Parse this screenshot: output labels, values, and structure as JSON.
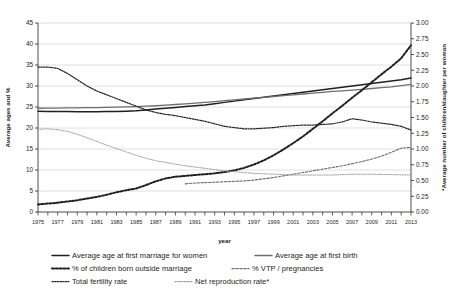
{
  "chart_data": {
    "type": "line",
    "title": "",
    "xlabel": "year",
    "ylabel": "Average ages and %",
    "y2label": "*Average number of children/daughter per woman",
    "xlim": [
      1975,
      2013
    ],
    "ylim": [
      0,
      45
    ],
    "y2lim": [
      0,
      3.0
    ],
    "grid": true,
    "legend_position": "bottom",
    "y_ticks": [
      "0",
      "5",
      "10",
      "15",
      "20",
      "25",
      "30",
      "35",
      "40",
      "45"
    ],
    "y2_ticks": [
      "0.00",
      "0.25",
      "0.50",
      "0.75",
      "1.00",
      "1.25",
      "1.50",
      "1.75",
      "2.00",
      "2.25",
      "2.50",
      "2.75",
      "3.00"
    ],
    "x_ticks": [
      "1975",
      "1977",
      "1979",
      "1981",
      "1983",
      "1985",
      "1987",
      "1989",
      "1991",
      "1993",
      "1995",
      "1997",
      "1999",
      "2001",
      "2003",
      "2005",
      "2007",
      "2009",
      "2011",
      "2013"
    ],
    "x_all_years": [
      1975,
      1976,
      1977,
      1978,
      1979,
      1980,
      1981,
      1982,
      1983,
      1984,
      1985,
      1986,
      1987,
      1988,
      1989,
      1990,
      1991,
      1992,
      1993,
      1994,
      1995,
      1996,
      1997,
      1998,
      1999,
      2000,
      2001,
      2002,
      2003,
      2004,
      2005,
      2006,
      2007,
      2008,
      2009,
      2010,
      2011,
      2012,
      2013
    ],
    "series": [
      {
        "name": "Average age at first marriage for women",
        "axis": "left",
        "style": "solid",
        "color": "#231f20",
        "width": 1.5,
        "x": [
          1975,
          1976,
          1977,
          1978,
          1979,
          1980,
          1981,
          1982,
          1983,
          1984,
          1985,
          1986,
          1987,
          1988,
          1989,
          1990,
          1991,
          1992,
          1993,
          1994,
          1995,
          1996,
          1997,
          1998,
          1999,
          2000,
          2001,
          2002,
          2003,
          2004,
          2005,
          2006,
          2007,
          2008,
          2009,
          2010,
          2011,
          2012,
          2013
        ],
        "values": [
          24.0,
          23.95,
          23.9,
          23.9,
          23.85,
          23.85,
          23.85,
          23.9,
          23.95,
          24.0,
          24.1,
          24.3,
          24.5,
          24.7,
          24.9,
          25.1,
          25.3,
          25.5,
          25.8,
          26.1,
          26.4,
          26.7,
          27.0,
          27.3,
          27.6,
          27.9,
          28.2,
          28.5,
          28.8,
          29.1,
          29.4,
          29.7,
          30.0,
          30.3,
          30.6,
          30.9,
          31.2,
          31.5,
          31.9
        ]
      },
      {
        "name": "Average age at first birth",
        "axis": "left",
        "style": "solid",
        "color": "#6d6e70",
        "width": 1.3,
        "x": [
          1975,
          1976,
          1977,
          1978,
          1979,
          1980,
          1981,
          1982,
          1983,
          1984,
          1985,
          1986,
          1987,
          1988,
          1989,
          1990,
          1991,
          1992,
          1993,
          1994,
          1995,
          1996,
          1997,
          1998,
          1999,
          2000,
          2001,
          2002,
          2003,
          2004,
          2005,
          2006,
          2007,
          2008,
          2009,
          2010,
          2011,
          2012,
          2013
        ],
        "values": [
          24.7,
          24.72,
          24.74,
          24.77,
          24.8,
          24.83,
          24.87,
          24.92,
          24.97,
          25.03,
          25.1,
          25.2,
          25.3,
          25.45,
          25.6,
          25.75,
          25.9,
          26.1,
          26.3,
          26.5,
          26.7,
          26.9,
          27.1,
          27.3,
          27.5,
          27.7,
          27.9,
          28.1,
          28.3,
          28.5,
          28.7,
          28.85,
          29.0,
          29.2,
          29.4,
          29.6,
          29.8,
          30.1,
          30.4
        ]
      },
      {
        "name": "% of children born outside marriage",
        "axis": "left",
        "style": "dotted-bold",
        "color": "#231f20",
        "width": 2.0,
        "x": [
          1975,
          1976,
          1977,
          1978,
          1979,
          1980,
          1981,
          1982,
          1983,
          1984,
          1985,
          1986,
          1987,
          1988,
          1989,
          1990,
          1991,
          1992,
          1993,
          1994,
          1995,
          1996,
          1997,
          1998,
          1999,
          2000,
          2001,
          2002,
          2003,
          2004,
          2005,
          2006,
          2007,
          2008,
          2009,
          2010,
          2011,
          2012,
          2013
        ],
        "values": [
          1.8,
          2.0,
          2.2,
          2.5,
          2.8,
          3.2,
          3.6,
          4.1,
          4.7,
          5.2,
          5.6,
          6.4,
          7.3,
          8.0,
          8.4,
          8.6,
          8.8,
          9.0,
          9.2,
          9.5,
          9.9,
          10.5,
          11.3,
          12.3,
          13.5,
          14.9,
          16.4,
          18.0,
          19.8,
          21.6,
          23.5,
          25.3,
          27.2,
          29.0,
          30.9,
          32.8,
          34.6,
          36.6,
          39.7
        ]
      },
      {
        "name": "% VTP / pregnancies",
        "axis": "left",
        "style": "dashed",
        "color": "#6d6e70",
        "width": 1.1,
        "x": [
          1990,
          1991,
          1992,
          1993,
          1994,
          1995,
          1996,
          1997,
          1998,
          1999,
          2000,
          2001,
          2002,
          2003,
          2004,
          2005,
          2006,
          2007,
          2008,
          2009,
          2010,
          2011,
          2012,
          2013
        ],
        "values": [
          6.7,
          6.9,
          7.0,
          7.1,
          7.2,
          7.3,
          7.4,
          7.6,
          7.9,
          8.2,
          8.6,
          9.0,
          9.4,
          9.8,
          10.2,
          10.6,
          11.0,
          11.5,
          12.0,
          12.6,
          13.3,
          14.2,
          15.2,
          15.4
        ]
      },
      {
        "name": "Total fertility rate",
        "axis": "right",
        "style": "dotted",
        "color": "#231f20",
        "width": 1.2,
        "x": [
          1975,
          1976,
          1977,
          1978,
          1979,
          1980,
          1981,
          1982,
          1983,
          1984,
          1985,
          1986,
          1987,
          1988,
          1989,
          1990,
          1991,
          1992,
          1993,
          1994,
          1995,
          1996,
          1997,
          1998,
          1999,
          2000,
          2001,
          2002,
          2003,
          2004,
          2005,
          2006,
          2007,
          2008,
          2009,
          2010,
          2011,
          2012,
          2013
        ],
        "values": [
          2.3,
          2.3,
          2.28,
          2.2,
          2.1,
          2.0,
          1.92,
          1.86,
          1.8,
          1.74,
          1.68,
          1.62,
          1.58,
          1.55,
          1.53,
          1.5,
          1.47,
          1.44,
          1.4,
          1.36,
          1.34,
          1.32,
          1.32,
          1.33,
          1.34,
          1.36,
          1.37,
          1.38,
          1.38,
          1.39,
          1.4,
          1.43,
          1.48,
          1.46,
          1.43,
          1.41,
          1.39,
          1.36,
          1.3
        ]
      },
      {
        "name": "Net reproduction rate*",
        "axis": "left",
        "style": "fine-dotted",
        "color": "#9a9b9e",
        "width": 1.0,
        "x": [
          1975,
          1976,
          1977,
          1978,
          1979,
          1980,
          1981,
          1982,
          1983,
          1984,
          1985,
          1986,
          1987,
          1988,
          1989,
          1990,
          1991,
          1992,
          1993,
          1994,
          1995,
          1996,
          1997,
          1998,
          1999,
          2000,
          2001,
          2002,
          2003,
          2004,
          2005,
          2006,
          2007,
          2008,
          2009,
          2010,
          2011,
          2012,
          2013
        ],
        "values": [
          19.7,
          19.8,
          19.6,
          19.2,
          18.5,
          17.7,
          16.8,
          15.9,
          15.1,
          14.3,
          13.5,
          12.8,
          12.2,
          11.8,
          11.4,
          11.0,
          10.7,
          10.4,
          10.1,
          9.8,
          9.6,
          9.4,
          9.2,
          9.1,
          9.0,
          8.9,
          8.8,
          8.8,
          8.8,
          8.8,
          8.8,
          8.9,
          9.0,
          9.0,
          9.0,
          8.95,
          8.9,
          8.85,
          8.8
        ]
      }
    ]
  },
  "legend": {
    "items": [
      {
        "label": "Average age at first marriage for women",
        "style": "solid",
        "color": "#231f20"
      },
      {
        "label": "Average age at first birth",
        "style": "solid",
        "color": "#6d6e70"
      },
      {
        "label": "% of children born outside marriage",
        "style": "dotted-bold",
        "color": "#231f20"
      },
      {
        "label": "% VTP / pregnancies",
        "style": "dashed",
        "color": "#6d6e70"
      },
      {
        "label": "Total fertility rate",
        "style": "dotted",
        "color": "#231f20"
      },
      {
        "label": "Net reproduction rate*",
        "style": "fine-dotted",
        "color": "#9a9b9e"
      }
    ]
  },
  "colors": {
    "axis": "#231f20",
    "grid": "#bcbec0",
    "background": "#ffffff"
  }
}
